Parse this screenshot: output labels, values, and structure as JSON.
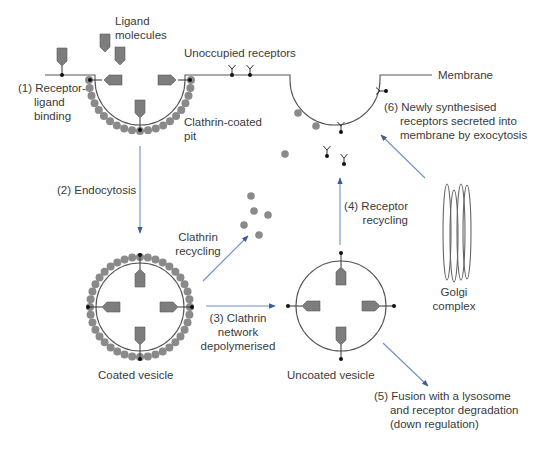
{
  "labels": {
    "ligand_molecules": "Ligand\nmolecules",
    "unoccupied_receptors": "Unoccupied receptors",
    "membrane": "Membrane",
    "step1": "(1) Receptor-\n     ligand\n     binding",
    "clathrin_coated_pit": "Clathrin-coated\npit",
    "step6": "(6) Newly synthesised\n     receptors secreted into\n     membrane by exocytosis",
    "step2": "(2) Endocytosis",
    "clathrin_recycling": "Clathrin\nrecycling",
    "step4": "(4) Receptor\n recycling",
    "golgi_complex": "Golgi\ncomplex",
    "step3": "(3) Clathrin\nnetwork\ndepolymerised",
    "coated_vesicle": "Coated vesicle",
    "uncoated_vesicle": "Uncoated vesicle",
    "step5": "(5) Fusion with a lysosome\n     and receptor degradation\n     (down regulation)"
  },
  "colors": {
    "arrow": "#6f8fc9",
    "arrowhead": "#3b5aa6",
    "line": "#555555",
    "clathrin": "#8a8a8a",
    "ligand": "#7d7d7d",
    "dot": "#111111"
  }
}
